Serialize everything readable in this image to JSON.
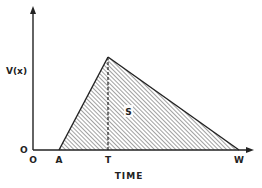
{
  "diagram": {
    "type": "triangular-area-plot",
    "y_axis_label": "V(x)",
    "x_axis_label": "TIME",
    "y_origin_label": "O",
    "x_tick_labels": [
      {
        "label": "O",
        "x": 33
      },
      {
        "label": "A",
        "x": 59
      },
      {
        "label": "T",
        "x": 108
      },
      {
        "label": "W",
        "x": 239
      }
    ],
    "area_label": "S",
    "points": {
      "A": [
        59,
        150
      ],
      "peak": [
        108,
        57
      ],
      "W": [
        239,
        150
      ]
    },
    "colors": {
      "line": "#222222",
      "hatch": "#444444",
      "background": "#ffffff"
    }
  }
}
